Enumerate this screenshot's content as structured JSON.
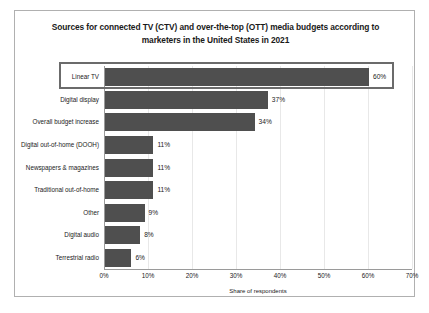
{
  "chart_data": {
    "type": "bar",
    "orientation": "horizontal",
    "title": "Sources for connected TV (CTV) and over-the-top (OTT) media budgets according to marketers in the United States in 2021",
    "title_line1": "Sources for connected TV (CTV) and over-the-top (OTT) media budgets according to",
    "title_line2": "marketers in the United States in 2021",
    "xlabel": "Share of respondents",
    "ylabel": "",
    "categories": [
      "Linear TV",
      "Digital display",
      "Overall budget increase",
      "Digital out-of-home (DOOH)",
      "Newspapers & magazines",
      "Traditional out-of-home",
      "Other",
      "Digital audio",
      "Terrestrial radio"
    ],
    "values": [
      60,
      37,
      34,
      11,
      11,
      11,
      9,
      8,
      6
    ],
    "value_labels": [
      "60%",
      "37%",
      "34%",
      "11%",
      "11%",
      "11%",
      "9%",
      "8%",
      "6%"
    ],
    "xlim": [
      0,
      70
    ],
    "xticks": [
      0,
      10,
      20,
      30,
      40,
      50,
      60,
      70
    ],
    "xtick_labels": [
      "0%",
      "10%",
      "20%",
      "30%",
      "40%",
      "50%",
      "60%",
      "70%"
    ],
    "grid": true,
    "legend": "none",
    "bar_color": "#4f4f4f",
    "highlight": {
      "category": "Linear TV",
      "border_color": "#6b6b6b"
    }
  }
}
